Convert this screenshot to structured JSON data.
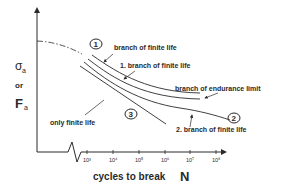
{
  "diagram": {
    "type": "S-N fatigue curve (Wöhler diagram)",
    "y_axis": {
      "label_top": "σ",
      "label_top_sub": "a",
      "label_mid": "or",
      "label_bottom": "F",
      "label_bottom_sub": "a"
    },
    "x_axis": {
      "title": "cycles to break",
      "title_symbol": "N",
      "ticks": [
        "10³",
        "10⁴",
        "10⁵",
        "10⁶",
        "10⁷",
        "10⁸"
      ]
    },
    "annotations": {
      "branch_finite_life": "branch of finite life",
      "first_branch_finite_life": "1. branch of finite life",
      "branch_endurance_limit": "branch of endurance limit",
      "second_branch_finite_life": "2. branch of finite life",
      "only_finite_life": "only finite life"
    },
    "markers": {
      "one": "1",
      "two": "2",
      "three": "3"
    }
  },
  "colors": {
    "line": "#2a2a2a",
    "background": "#ffffff"
  }
}
